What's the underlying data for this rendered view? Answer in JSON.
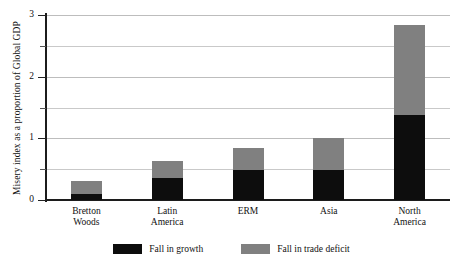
{
  "chart_data": {
    "type": "bar",
    "stacked": true,
    "title": "",
    "subtitle": "",
    "xlabel": "",
    "ylabel": "Misery index as a proportion of Global GDP",
    "categories": [
      "Bretton Woods",
      "Latin America",
      "ERM",
      "Asia",
      "North America"
    ],
    "category_lines": [
      [
        "Bretton",
        "Woods"
      ],
      [
        "Latin",
        "America"
      ],
      [
        "ERM"
      ],
      [
        "Asia"
      ],
      [
        "North",
        "America"
      ]
    ],
    "series": [
      {
        "name": "Fall in growth",
        "color": "#0d0d0d",
        "values": [
          0.1,
          0.36,
          0.48,
          0.48,
          1.38
        ]
      },
      {
        "name": "Fall in trade deficit",
        "color": "#808080",
        "values": [
          0.21,
          0.28,
          0.37,
          0.52,
          1.45
        ]
      }
    ],
    "totals": [
      0.31,
      0.64,
      0.85,
      1.0,
      2.83
    ],
    "ylim": [
      0,
      3
    ],
    "yticks": [
      0,
      1,
      2,
      3
    ],
    "ytick_labels": [
      "0",
      "1",
      "2",
      "3"
    ],
    "yminorticks": [
      0.5,
      1.5,
      2.5
    ],
    "gridlines": [
      0.5,
      1.0,
      1.5,
      2.0,
      2.5,
      3.0
    ],
    "grid": true,
    "grid_axis": "y",
    "legend_position": "bottom"
  },
  "legend": {
    "items": [
      {
        "label": "Fall in growth",
        "color": "#0d0d0d",
        "swatch_name": "legend-swatch-growth"
      },
      {
        "label": "Fall in trade deficit",
        "color": "#808080",
        "swatch_name": "legend-swatch-deficit"
      }
    ]
  },
  "axes": {
    "y_title": "Misery index as a proportion of Global GDP"
  },
  "colors": {
    "growth": "#0d0d0d",
    "deficit": "#808080",
    "axis": "#1c1c1c",
    "grid": "#c9c9c9",
    "background": "#ffffff",
    "text": "#111111"
  }
}
